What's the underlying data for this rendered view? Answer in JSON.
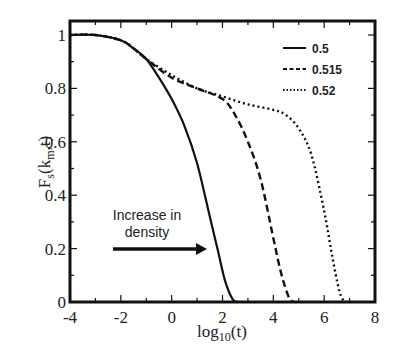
{
  "chart_data": {
    "type": "line",
    "title": "",
    "xlabel": "log10(t)",
    "ylabel": "F_s(k_m,t)",
    "xlim": [
      -4,
      8
    ],
    "ylim": [
      0,
      1.05
    ],
    "xticks": [
      -4,
      -2,
      0,
      2,
      4,
      6,
      8
    ],
    "yticks": [
      0,
      0.2,
      0.4,
      0.6,
      0.8,
      1
    ],
    "xtick_labels": [
      "-4",
      "-2",
      "0",
      "2",
      "4",
      "6",
      "8"
    ],
    "ytick_labels": [
      "0",
      "0.2",
      "0.4",
      "0.6",
      "0.8",
      "1"
    ],
    "grid": false,
    "legend_position": "upper right",
    "series": [
      {
        "name": "0.5",
        "style": "solid",
        "x": [
          -4,
          -3,
          -2,
          -1.5,
          -1,
          -0.5,
          0,
          0.5,
          1,
          1.5,
          1.8,
          2.1,
          2.4,
          2.6
        ],
        "y": [
          1,
          1,
          0.98,
          0.95,
          0.91,
          0.84,
          0.76,
          0.66,
          0.52,
          0.32,
          0.2,
          0.08,
          0.01,
          0
        ]
      },
      {
        "name": "0.515",
        "style": "dashed",
        "x": [
          -4,
          -3,
          -2,
          -1.5,
          -1,
          0,
          1,
          2,
          2.5,
          3,
          3.5,
          4,
          4.3,
          4.6,
          4.8
        ],
        "y": [
          1,
          1,
          0.98,
          0.95,
          0.91,
          0.84,
          0.8,
          0.76,
          0.7,
          0.6,
          0.46,
          0.24,
          0.11,
          0.02,
          0
        ]
      },
      {
        "name": "0.52",
        "style": "dotted",
        "x": [
          -4,
          -3,
          -2,
          -1.5,
          -1,
          0,
          1,
          2,
          3,
          4,
          4.5,
          5,
          5.5,
          6,
          6.3,
          6.6,
          6.8
        ],
        "y": [
          1,
          1,
          0.98,
          0.95,
          0.91,
          0.85,
          0.8,
          0.77,
          0.74,
          0.72,
          0.7,
          0.65,
          0.55,
          0.34,
          0.18,
          0.04,
          0
        ]
      }
    ],
    "annotations": [
      {
        "text": "Increase in density",
        "type": "arrow",
        "from": [
          -2.3,
          0.2
        ],
        "to": [
          1.3,
          0.2
        ]
      }
    ]
  },
  "labels": {
    "ylabel_main": "F",
    "ylabel_sub1": "s",
    "ylabel_paren": "(k",
    "ylabel_sub2": "m",
    "ylabel_end": ",t)",
    "xlabel_main": "log",
    "xlabel_sub": "10",
    "xlabel_end": "(t)",
    "annotation_line1": "Increase in",
    "annotation_line2": "density"
  }
}
